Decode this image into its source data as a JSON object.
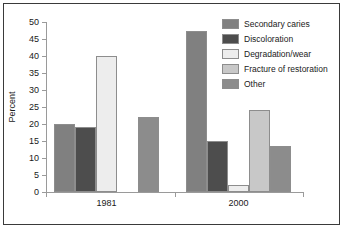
{
  "chart_data": {
    "type": "bar",
    "title": "",
    "xlabel": "",
    "ylabel": "Percent",
    "categories": [
      "1981",
      "2000"
    ],
    "ylim": [
      0,
      50
    ],
    "yticks": [
      0,
      5,
      10,
      15,
      20,
      25,
      30,
      35,
      40,
      45,
      50
    ],
    "ytick_labels": [
      "0",
      "5",
      "10",
      "15",
      "20",
      "25",
      "30",
      "35",
      "40",
      "45",
      "50"
    ],
    "grid": false,
    "legend_position": "upper-right",
    "series": [
      {
        "name": "Secondary caries",
        "color": "#808080",
        "values": [
          20,
          47.5
        ]
      },
      {
        "name": "Discoloration",
        "color": "#4d4d4d",
        "values": [
          19,
          15
        ]
      },
      {
        "name": "Degradation/wear",
        "color": "#ededed",
        "values": [
          40,
          2
        ]
      },
      {
        "name": "Fracture of restoration",
        "color": "#c8c8c8",
        "values": [
          null,
          24
        ]
      },
      {
        "name": "Other",
        "color": "#8c8c8c",
        "values": [
          22,
          13.5
        ]
      }
    ]
  },
  "legend": {
    "items": [
      {
        "label": "Secondary caries"
      },
      {
        "label": "Discoloration"
      },
      {
        "label": "Degradation/wear"
      },
      {
        "label": "Fracture of restoration"
      },
      {
        "label": "Other"
      }
    ]
  },
  "axis": {
    "y_title": "Percent",
    "y_labels": [
      "50",
      "45",
      "40",
      "35",
      "30",
      "25",
      "20",
      "15",
      "10",
      "5",
      "0"
    ],
    "x_labels": [
      "1981",
      "2000"
    ]
  }
}
